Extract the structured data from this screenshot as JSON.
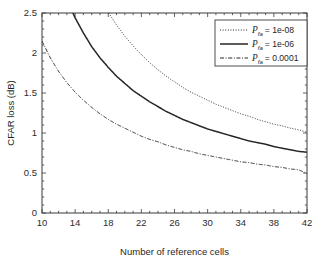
{
  "chart_data": {
    "type": "line",
    "title": "",
    "xlabel": "Number of reference cells",
    "ylabel": "CFAR loss (dB)",
    "xlim": [
      10,
      42
    ],
    "ylim": [
      0,
      2.5
    ],
    "xticks": [
      10,
      14,
      18,
      22,
      26,
      30,
      34,
      38,
      42
    ],
    "xticklabels": [
      "10",
      "14",
      "18",
      "22",
      "26",
      "30",
      "34",
      "38",
      "42"
    ],
    "yticks": [
      0,
      0.5,
      1,
      1.5,
      2,
      2.5
    ],
    "yticklabels": [
      "0",
      "0.5",
      "1",
      "1.5",
      "2",
      "2.5"
    ],
    "grid": false,
    "box": true,
    "legend_position": "top-right",
    "series": [
      {
        "name": "P_fa = 1e-08",
        "label_prefix": "P",
        "label_subscript": "fa",
        "label_equals": "=",
        "label_value": "1e-08",
        "style": "dotted",
        "color": "#262626",
        "x": [
          10,
          11,
          12,
          13,
          14,
          15,
          16,
          17,
          18,
          19,
          20,
          21,
          22,
          23,
          24,
          25,
          26,
          27,
          28,
          29,
          30,
          31,
          32,
          33,
          34,
          35,
          36,
          37,
          38,
          39,
          40,
          41,
          42
        ],
        "y": [
          5.52,
          4.81,
          4.26,
          3.82,
          3.46,
          3.16,
          2.91,
          2.7,
          2.51,
          2.35,
          2.21,
          2.09,
          1.98,
          1.88,
          1.79,
          1.71,
          1.64,
          1.57,
          1.51,
          1.46,
          1.41,
          1.36,
          1.32,
          1.28,
          1.24,
          1.21,
          1.17,
          1.14,
          1.11,
          1.09,
          1.06,
          1.04,
          1.01
        ]
      },
      {
        "name": "P_fa = 1e-06",
        "label_prefix": "P",
        "label_subscript": "fa",
        "label_equals": "=",
        "label_value": "1e-06",
        "style": "solid",
        "color": "#262626",
        "x": [
          10,
          11,
          12,
          13,
          14,
          15,
          16,
          17,
          18,
          19,
          20,
          21,
          22,
          23,
          24,
          25,
          26,
          27,
          28,
          29,
          30,
          31,
          32,
          33,
          34,
          35,
          36,
          37,
          38,
          39,
          40,
          41,
          42
        ],
        "y": [
          3.73,
          3.29,
          2.95,
          2.67,
          2.44,
          2.25,
          2.08,
          1.94,
          1.82,
          1.71,
          1.62,
          1.53,
          1.46,
          1.39,
          1.33,
          1.27,
          1.22,
          1.17,
          1.13,
          1.09,
          1.05,
          1.02,
          0.99,
          0.96,
          0.93,
          0.9,
          0.88,
          0.86,
          0.83,
          0.81,
          0.79,
          0.77,
          0.76
        ]
      },
      {
        "name": "P_fa = 0.0001",
        "label_prefix": "P",
        "label_subscript": "fa",
        "label_equals": "=",
        "label_value": "0.0001",
        "style": "dashdot",
        "color": "#262626",
        "x": [
          10,
          11,
          12,
          13,
          14,
          15,
          16,
          17,
          18,
          19,
          20,
          21,
          22,
          23,
          24,
          25,
          26,
          27,
          28,
          29,
          30,
          31,
          32,
          33,
          34,
          35,
          36,
          37,
          38,
          39,
          40,
          41,
          42
        ],
        "y": [
          2.15,
          1.94,
          1.77,
          1.63,
          1.51,
          1.41,
          1.32,
          1.24,
          1.17,
          1.11,
          1.06,
          1.01,
          0.96,
          0.92,
          0.89,
          0.85,
          0.82,
          0.79,
          0.77,
          0.74,
          0.72,
          0.7,
          0.68,
          0.66,
          0.64,
          0.63,
          0.61,
          0.6,
          0.58,
          0.57,
          0.55,
          0.54,
          0.49
        ]
      }
    ]
  }
}
